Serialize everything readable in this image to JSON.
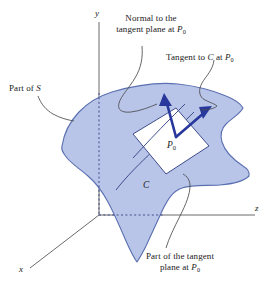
{
  "figure": {
    "type": "math-diagram",
    "colors": {
      "surface_fill": "#b9c5e8",
      "surface_stroke": "#5a6fb0",
      "vector": "#27379b",
      "axis": "#6b6b6b",
      "leader": "#4a4a52",
      "tangent_plane_fill": "#ffffff",
      "text": "#1a1a1a"
    }
  },
  "axes": {
    "x_label": "x",
    "y_label": "y",
    "z_label": "z"
  },
  "callouts": {
    "normal": {
      "line1": "Normal to the",
      "line2_pre": "tangent plane at ",
      "line2_var": "P",
      "line2_sub": "0"
    },
    "tangent": {
      "pre": "Tangent to ",
      "var1": "C",
      "mid": " at ",
      "var2": "P",
      "sub": "0"
    },
    "part_of_s": {
      "pre": "Part of ",
      "var": "S"
    },
    "tangent_plane": {
      "line1": "Part of the tangent",
      "line2_pre": "plane at ",
      "line2_var": "P",
      "line2_sub": "0"
    }
  },
  "point_labels": {
    "p0_var": "P",
    "p0_sub": "0",
    "curve_c": "C"
  }
}
